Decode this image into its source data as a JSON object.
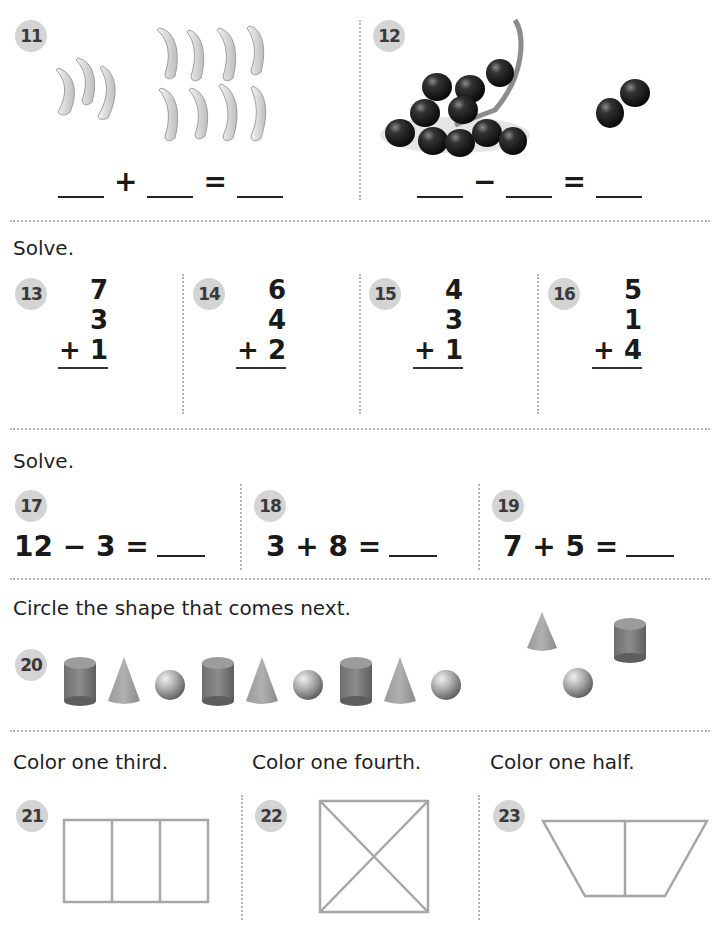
{
  "problems": {
    "p11": {
      "number": "11",
      "operator": "+",
      "equals": "=",
      "left_group_count": 3,
      "right_group_count": 8,
      "object": "banana"
    },
    "p12": {
      "number": "12",
      "operator": "−",
      "equals": "=",
      "bunch_count": 11,
      "separate_count": 2,
      "object": "grape"
    },
    "p13": {
      "number": "13",
      "rows": [
        "7",
        "3",
        "+ 1"
      ]
    },
    "p14": {
      "number": "14",
      "rows": [
        "6",
        "4",
        "+ 2"
      ]
    },
    "p15": {
      "number": "15",
      "rows": [
        "4",
        "3",
        "+ 1"
      ]
    },
    "p16": {
      "number": "16",
      "rows": [
        "5",
        "1",
        "+ 4"
      ]
    },
    "p17": {
      "number": "17",
      "expression": "12 − 3 ="
    },
    "p18": {
      "number": "18",
      "expression": "3 + 8 ="
    },
    "p19": {
      "number": "19",
      "expression": "7 + 5 ="
    },
    "p20": {
      "number": "20",
      "pattern": [
        "cylinder",
        "cone",
        "sphere",
        "cylinder",
        "cone",
        "sphere",
        "cylinder",
        "cone",
        "sphere"
      ],
      "choices": [
        "cone",
        "cylinder",
        "sphere"
      ]
    },
    "p21": {
      "number": "21",
      "shape": "rectangle divided in 3 equal parts"
    },
    "p22": {
      "number": "22",
      "shape": "square divided in 4 triangles"
    },
    "p23": {
      "number": "23",
      "shape": "trapezoid divided in 2 halves"
    }
  },
  "instructions": {
    "solve1": "Solve.",
    "solve2": "Solve.",
    "circle_next": "Circle the shape that comes next.",
    "third": "Color one third.",
    "fourth": "Color one fourth.",
    "half": "Color one half."
  },
  "colors": {
    "badge": "#d4d4d4",
    "divider": "#b5b5b5",
    "shape_outline": "#a6a6a6"
  }
}
